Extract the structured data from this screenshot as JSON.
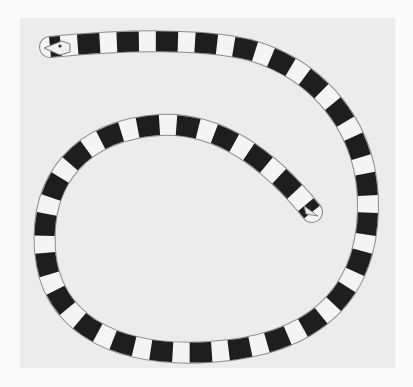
{
  "image": {
    "subject": "banded eel",
    "description": "Black-and-white photograph of a slender eel with alternating dark and light bands, body coiled in a loop with head at upper left and tail tip pointing inward toward center-right",
    "colors": {
      "background": "#ececec",
      "body_light": "#f4f4f4",
      "band_dark": "#1e1e1e",
      "outline": "#9a9a9a"
    }
  }
}
